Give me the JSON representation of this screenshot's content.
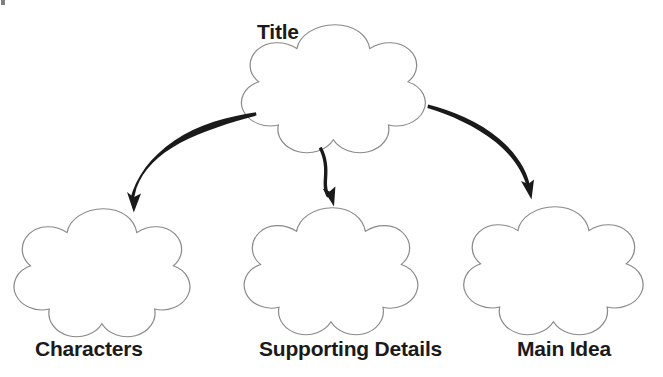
{
  "document": {
    "kind": "graphic-organizer-worksheet",
    "background_color": "#ffffff"
  },
  "diagram": {
    "type": "cloud-tree-organizer",
    "outline_color": "#8a8a8a",
    "arrow_color": "#1a1a1a",
    "text_color": "#1a1a1a",
    "root": {
      "label": "Title",
      "shape": "five-lobed-cloud",
      "label_position": "top-left-outside"
    },
    "children": [
      {
        "label": "Characters",
        "shape": "five-lobed-cloud",
        "label_position": "below"
      },
      {
        "label": "Supporting Details",
        "shape": "five-lobed-cloud",
        "label_position": "below"
      },
      {
        "label": "Main Idea",
        "shape": "five-lobed-cloud",
        "label_position": "below"
      }
    ],
    "connectors": [
      {
        "name": "arrow-to-characters",
        "from": "Title",
        "to": "Characters",
        "style": "curved-hand-drawn"
      },
      {
        "name": "arrow-to-supporting-details",
        "from": "Title",
        "to": "Supporting Details",
        "style": "short-vertical-hand-drawn"
      },
      {
        "name": "arrow-to-main-idea",
        "from": "Title",
        "to": "Main Idea",
        "style": "curved-hand-drawn"
      }
    ]
  }
}
